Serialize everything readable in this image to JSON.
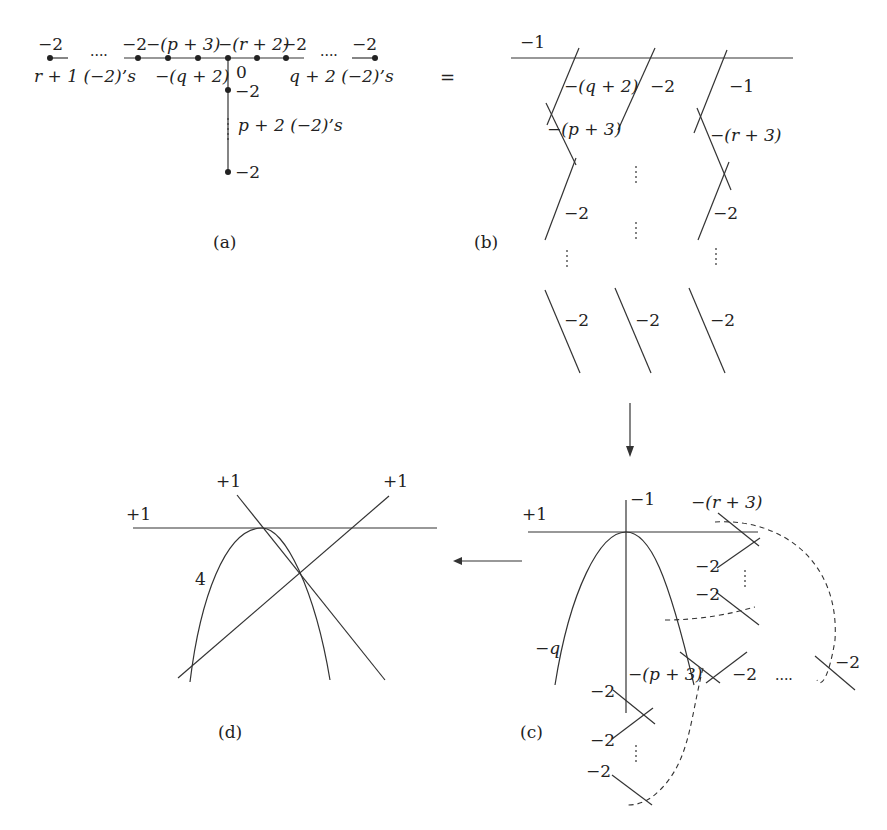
{
  "panel_a": {
    "caption": "(a)",
    "top_labels": [
      "−2",
      "....",
      "−2",
      "−(p + 3)",
      "−(r + 2)",
      "−2",
      "....",
      "−2"
    ],
    "left_count": "r + 1 (−2)’s",
    "mid_label": "−(q + 2)",
    "zero_label": "0",
    "right_count": "q + 2 (−2)’s",
    "vert_top": "−2",
    "vert_count": "p + 2 (−2)’s",
    "vert_bottom": "−2"
  },
  "equals": "=",
  "panel_b": {
    "caption": "(b)",
    "top_line": "−1",
    "col1": [
      "−(q + 2)",
      "−(p + 3)",
      "−2",
      "−2"
    ],
    "col2": [
      "−2",
      "−2"
    ],
    "col3": [
      "−1",
      "−(r + 3)",
      "−2",
      "−2"
    ]
  },
  "panel_c": {
    "caption": "(c)",
    "plus1": "+1",
    "minus1": "−1",
    "r3": "−(r + 3)",
    "m2a": "−2",
    "m2b": "−2",
    "q": "−q",
    "p3": "−(p + 3)",
    "m2c": "−2",
    "dots": "....",
    "m2d": "−2",
    "m2e": "−2",
    "m2f": "−2",
    "m2g": "−2"
  },
  "panel_d": {
    "caption": "(d)",
    "plus1_left": "+1",
    "plus1_mid": "+1",
    "plus1_right": "+1",
    "four": "4"
  }
}
